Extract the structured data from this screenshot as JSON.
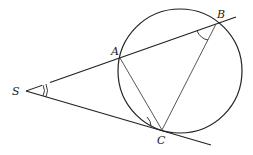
{
  "diagram": {
    "type": "geometry",
    "points": {
      "S": {
        "label": "S",
        "x": 26,
        "y": 91
      },
      "A": {
        "label": "A",
        "x": 120,
        "y": 58
      },
      "B": {
        "label": "B",
        "x": 216,
        "y": 24
      },
      "C": {
        "label": "C",
        "x": 162,
        "y": 130
      }
    },
    "circle": {
      "cx": 180,
      "cy": 71,
      "r": 62
    },
    "segments": [
      [
        "S",
        "B"
      ],
      [
        "S",
        "C"
      ],
      [
        "A",
        "C"
      ],
      [
        "B",
        "C"
      ]
    ],
    "marked_angles": [
      "ASC",
      "SCA",
      "ABC"
    ],
    "colors": {
      "stroke": "#222222",
      "background": "#ffffff"
    }
  }
}
